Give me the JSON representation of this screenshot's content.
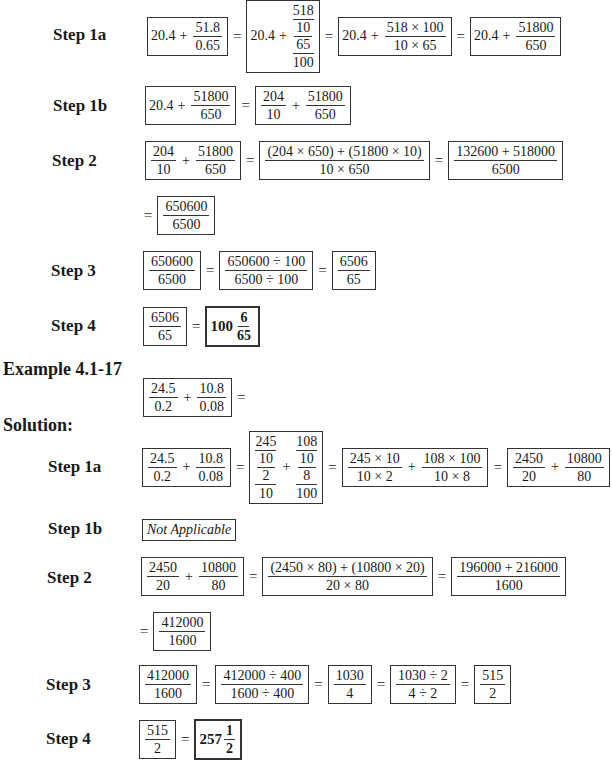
{
  "example1": {
    "step1a": {
      "label": "Step 1a",
      "e1": {
        "whole": "20.4",
        "plus": "+",
        "num": "51.8",
        "den": "0.65"
      },
      "e2": {
        "whole": "20.4",
        "plus": "+",
        "top": "518",
        "tn": "10",
        "bn": "65",
        "bottom": "100"
      },
      "e3": {
        "whole": "20.4",
        "plus": "+",
        "num": "518 × 100",
        "den": "10 × 65"
      },
      "e4": {
        "whole": "20.4",
        "plus": "+",
        "num": "51800",
        "den": "650"
      },
      "eq": "="
    },
    "step1b": {
      "label": "Step 1b",
      "e1": {
        "whole": "20.4",
        "plus": "+",
        "num": "51800",
        "den": "650"
      },
      "e2": {
        "n1": "204",
        "d1": "10",
        "plus": "+",
        "n2": "51800",
        "d2": "650"
      }
    },
    "step2": {
      "label": "Step 2",
      "e1": {
        "n1": "204",
        "d1": "10",
        "plus": "+",
        "n2": "51800",
        "d2": "650"
      },
      "e2": {
        "num": "(204 × 650) + (51800 × 10)",
        "den": "10 × 650"
      },
      "e3": {
        "num": "132600 + 518000",
        "den": "6500"
      },
      "e4": {
        "num": "650600",
        "den": "6500"
      }
    },
    "step3": {
      "label": "Step 3",
      "e1": {
        "num": "650600",
        "den": "6500"
      },
      "e2": {
        "num": "650600 ÷ 100",
        "den": "6500 ÷ 100"
      },
      "e3": {
        "num": "6506",
        "den": "65"
      }
    },
    "step4": {
      "label": "Step 4",
      "e1": {
        "num": "6506",
        "den": "65"
      },
      "answer": {
        "whole": "100",
        "num": "6",
        "den": "65"
      }
    }
  },
  "example2": {
    "title": "Example 4.1-17",
    "problem": {
      "n1": "24.5",
      "d1": "0.2",
      "plus": "+",
      "n2": "10.8",
      "d2": "0.08",
      "eq": "="
    },
    "solution_label": "Solution:",
    "step1a": {
      "label": "Step 1a",
      "e1": {
        "n1": "24.5",
        "d1": "0.2",
        "plus": "+",
        "n2": "10.8",
        "d2": "0.08"
      },
      "e2": {
        "t1": "245",
        "a1": "10",
        "b1": "2",
        "bt1": "10",
        "plus": "+",
        "t2": "108",
        "a2": "10",
        "b2": "8",
        "bt2": "100"
      },
      "e3": {
        "n1": "245 × 10",
        "d1": "10 × 2",
        "plus": "+",
        "n2": "108 × 100",
        "d2": "10 × 8"
      },
      "e4": {
        "n1": "2450",
        "d1": "20",
        "plus": "+",
        "n2": "10800",
        "d2": "80"
      }
    },
    "step1b": {
      "label": "Step 1b",
      "text": "Not Applicable"
    },
    "step2": {
      "label": "Step 2",
      "e1": {
        "n1": "2450",
        "d1": "20",
        "plus": "+",
        "n2": "10800",
        "d2": "80"
      },
      "e2": {
        "num": "(2450 × 80) + (10800 × 20)",
        "den": "20 × 80"
      },
      "e3": {
        "num": "196000 + 216000",
        "den": "1600"
      },
      "e4": {
        "num": "412000",
        "den": "1600"
      }
    },
    "step3": {
      "label": "Step 3",
      "e1": {
        "num": "412000",
        "den": "1600"
      },
      "e2": {
        "num": "412000 ÷ 400",
        "den": "1600 ÷ 400"
      },
      "e3": {
        "num": "1030",
        "den": "4"
      },
      "e4": {
        "num": "1030 ÷ 2",
        "den": "4 ÷ 2"
      },
      "e5": {
        "num": "515",
        "den": "2"
      }
    },
    "step4": {
      "label": "Step 4",
      "e1": {
        "num": "515",
        "den": "2"
      },
      "answer": {
        "whole": "257",
        "num": "1",
        "den": "2"
      }
    }
  },
  "symbols": {
    "eq": "="
  }
}
